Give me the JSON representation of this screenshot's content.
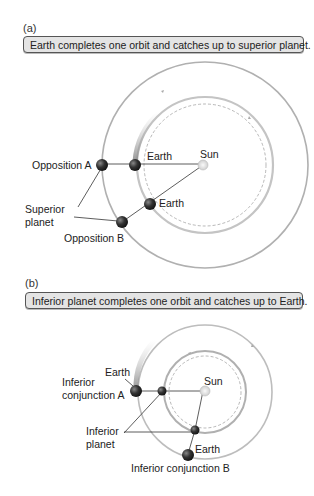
{
  "panel_a": {
    "label": "(a)",
    "caption": "Earth completes one orbit and catches up to superior planet.",
    "labels": {
      "opposition_a": "Opposition A",
      "earth_1": "Earth",
      "sun": "Sun",
      "earth_2": "Earth",
      "superior_line1": "Superior",
      "superior_line2": "planet",
      "opposition_b": "Opposition B"
    }
  },
  "panel_b": {
    "label": "(b)",
    "caption": "Inferior planet completes one orbit and catches up to Earth.",
    "labels": {
      "earth_1": "Earth",
      "inferior_conj_a_line1": "Inferior",
      "inferior_conj_a_line2": "conjunction A",
      "sun": "Sun",
      "inferior_planet_line1": "Inferior",
      "inferior_planet_line2": "planet",
      "earth_2": "Earth",
      "inferior_conj_b": "Inferior conjunction B"
    }
  },
  "colors": {
    "orbit_ring": "#b8b8b8",
    "caption_bg": "#e4e4e4",
    "planet_dark": "#2a2a2a",
    "sun": "#e8e8e8"
  }
}
